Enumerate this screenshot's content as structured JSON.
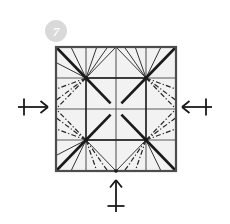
{
  "diagram": {
    "step_number": "7",
    "badge": {
      "label": "7",
      "fill_color": "#d9d9d9",
      "text_color": "#ffffff",
      "cx": 56,
      "cy": 31,
      "r": 11
    },
    "paper": {
      "name": "square-sheet",
      "x": 56,
      "y": 47,
      "width": 120,
      "height": 124,
      "fill_color": "#f2f2f2",
      "edge_color": "#4d4d4d",
      "edge_width": 2.2
    },
    "colors": {
      "background": "#ffffff",
      "paper_fill": "#f2f2f2",
      "paper_edge": "#4d4d4d",
      "mountain_bold": "#1a1a1a",
      "grid_line": "#595959",
      "thin_crease": "#333333",
      "valley_dash": "#262626",
      "arrow": "#1a1a1a"
    },
    "grid": {
      "divisions": 4,
      "vertical_fractions": [
        0.25,
        0.5,
        0.75
      ],
      "horizontal_fractions": [
        0.25,
        0.5,
        0.75
      ],
      "line_width": 1.1
    },
    "nodes": [
      {
        "name": "node-top-left",
        "fx": 0.25,
        "fy": 0.25
      },
      {
        "name": "node-top-right",
        "fx": 0.75,
        "fy": 0.25
      },
      {
        "name": "node-bottom-left",
        "fx": 0.25,
        "fy": 0.75
      },
      {
        "name": "node-bottom-right",
        "fx": 0.75,
        "fy": 0.75
      }
    ],
    "center_gap": 0.045,
    "bold_creases": [
      {
        "name": "mountain-corner-tl-to-node",
        "x1f": 0.0,
        "y1f": 0.0,
        "x2f": 0.25,
        "y2f": 0.25
      },
      {
        "name": "mountain-corner-tr-to-node",
        "x1f": 1.0,
        "y1f": 0.0,
        "x2f": 0.75,
        "y2f": 0.25
      },
      {
        "name": "mountain-corner-bl-to-node",
        "x1f": 0.0,
        "y1f": 1.0,
        "x2f": 0.25,
        "y2f": 0.75
      },
      {
        "name": "mountain-corner-br-to-node",
        "x1f": 1.0,
        "y1f": 1.0,
        "x2f": 0.75,
        "y2f": 0.75
      },
      {
        "name": "mountain-node-tl-to-center",
        "x1f": 0.25,
        "y1f": 0.25,
        "x2f": 0.455,
        "y2f": 0.455
      },
      {
        "name": "mountain-node-br-to-center",
        "x1f": 0.75,
        "y1f": 0.75,
        "x2f": 0.545,
        "y2f": 0.545
      },
      {
        "name": "mountain-node-tr-to-center",
        "x1f": 0.75,
        "y1f": 0.25,
        "x2f": 0.545,
        "y2f": 0.455
      },
      {
        "name": "mountain-node-bl-to-center",
        "x1f": 0.25,
        "y1f": 0.75,
        "x2f": 0.455,
        "y2f": 0.545
      },
      {
        "name": "mountain-node-tl-to-node-tr",
        "x1f": 0.25,
        "y1f": 0.25,
        "x2f": 0.75,
        "y2f": 0.25
      },
      {
        "name": "mountain-node-bl-to-node-br",
        "x1f": 0.25,
        "y1f": 0.75,
        "x2f": 0.75,
        "y2f": 0.75
      },
      {
        "name": "mountain-node-tl-to-node-bl",
        "x1f": 0.25,
        "y1f": 0.25,
        "x2f": 0.25,
        "y2f": 0.75
      },
      {
        "name": "mountain-node-tr-to-node-br",
        "x1f": 0.75,
        "y1f": 0.25,
        "x2f": 0.75,
        "y2f": 0.75
      }
    ],
    "thin_creases": [
      {
        "name": "fan-tl-to-top-left-corner-a",
        "x1f": 0.25,
        "y1f": 0.25,
        "x2f": 0.125,
        "y2f": 0.0
      },
      {
        "name": "fan-tl-to-top-a",
        "x1f": 0.25,
        "y1f": 0.25,
        "x2f": 0.34,
        "y2f": 0.0
      },
      {
        "name": "fan-tl-to-top-b",
        "x1f": 0.25,
        "y1f": 0.25,
        "x2f": 0.43,
        "y2f": 0.0
      },
      {
        "name": "fan-tl-to-top-c",
        "x1f": 0.25,
        "y1f": 0.25,
        "x2f": 0.5,
        "y2f": 0.0
      },
      {
        "name": "fan-tr-to-top-a",
        "x1f": 0.75,
        "y1f": 0.25,
        "x2f": 0.5,
        "y2f": 0.0
      },
      {
        "name": "fan-tr-to-top-b",
        "x1f": 0.75,
        "y1f": 0.25,
        "x2f": 0.57,
        "y2f": 0.0
      },
      {
        "name": "fan-tr-to-top-c",
        "x1f": 0.75,
        "y1f": 0.25,
        "x2f": 0.66,
        "y2f": 0.0
      },
      {
        "name": "fan-tr-to-top-right-corner-a",
        "x1f": 0.75,
        "y1f": 0.25,
        "x2f": 0.875,
        "y2f": 0.0
      },
      {
        "name": "fan-bl-to-bottom-a",
        "x1f": 0.25,
        "y1f": 0.75,
        "x2f": 0.125,
        "y2f": 1.0
      },
      {
        "name": "fan-bl-to-bottom-b",
        "x1f": 0.25,
        "y1f": 0.75,
        "x2f": 0.5,
        "y2f": 1.0
      },
      {
        "name": "fan-br-to-bottom-a",
        "x1f": 0.75,
        "y1f": 0.75,
        "x2f": 0.5,
        "y2f": 1.0
      },
      {
        "name": "fan-br-to-bottom-b",
        "x1f": 0.75,
        "y1f": 0.75,
        "x2f": 0.875,
        "y2f": 1.0
      },
      {
        "name": "fan-tl-to-left-a",
        "x1f": 0.25,
        "y1f": 0.25,
        "x2f": 0.0,
        "y2f": 0.125
      },
      {
        "name": "fan-bl-to-left-a",
        "x1f": 0.25,
        "y1f": 0.75,
        "x2f": 0.0,
        "y2f": 0.875
      }
    ],
    "valley_creases": [
      {
        "name": "valley-tl-to-left-upper",
        "x1f": 0.25,
        "y1f": 0.25,
        "x2f": 0.0,
        "y2f": 0.34
      },
      {
        "name": "valley-tl-to-left-mid",
        "x1f": 0.25,
        "y1f": 0.25,
        "x2f": 0.0,
        "y2f": 0.43
      },
      {
        "name": "valley-tl-to-left-low",
        "x1f": 0.25,
        "y1f": 0.25,
        "x2f": 0.0,
        "y2f": 0.5
      },
      {
        "name": "valley-bl-to-left-upper",
        "x1f": 0.25,
        "y1f": 0.75,
        "x2f": 0.0,
        "y2f": 0.5
      },
      {
        "name": "valley-bl-to-left-mid",
        "x1f": 0.25,
        "y1f": 0.75,
        "x2f": 0.0,
        "y2f": 0.57
      },
      {
        "name": "valley-bl-to-left-low",
        "x1f": 0.25,
        "y1f": 0.75,
        "x2f": 0.0,
        "y2f": 0.66
      },
      {
        "name": "valley-tr-to-right-upper",
        "x1f": 0.75,
        "y1f": 0.25,
        "x2f": 1.0,
        "y2f": 0.34
      },
      {
        "name": "valley-tr-to-right-mid",
        "x1f": 0.75,
        "y1f": 0.25,
        "x2f": 1.0,
        "y2f": 0.43
      },
      {
        "name": "valley-tr-to-right-low",
        "x1f": 0.75,
        "y1f": 0.25,
        "x2f": 1.0,
        "y2f": 0.5
      },
      {
        "name": "valley-br-to-right-upper",
        "x1f": 0.75,
        "y1f": 0.75,
        "x2f": 1.0,
        "y2f": 0.5
      },
      {
        "name": "valley-br-to-right-mid",
        "x1f": 0.75,
        "y1f": 0.75,
        "x2f": 1.0,
        "y2f": 0.57
      },
      {
        "name": "valley-br-to-right-low",
        "x1f": 0.75,
        "y1f": 0.75,
        "x2f": 1.0,
        "y2f": 0.66
      },
      {
        "name": "valley-bl-to-bottom-a",
        "x1f": 0.25,
        "y1f": 0.75,
        "x2f": 0.34,
        "y2f": 1.0
      },
      {
        "name": "valley-bl-to-bottom-b",
        "x1f": 0.25,
        "y1f": 0.75,
        "x2f": 0.43,
        "y2f": 1.0
      },
      {
        "name": "valley-br-to-bottom-a",
        "x1f": 0.75,
        "y1f": 0.75,
        "x2f": 0.57,
        "y2f": 1.0
      },
      {
        "name": "valley-br-to-bottom-b",
        "x1f": 0.75,
        "y1f": 0.75,
        "x2f": 0.66,
        "y2f": 1.0
      }
    ],
    "arrows": [
      {
        "name": "push-arrow-left",
        "direction": "right",
        "tick": "vertical",
        "shaft_x1": 18,
        "shaft_y1": 107,
        "shaft_x2": 48,
        "shaft_y2": 107,
        "tick_pos": 24
      },
      {
        "name": "push-arrow-right",
        "direction": "left",
        "tick": "vertical",
        "shaft_x1": 212,
        "shaft_y1": 107,
        "shaft_x2": 182,
        "shaft_y2": 107,
        "tick_pos": 206
      },
      {
        "name": "push-arrow-bottom",
        "direction": "up",
        "tick": "horizontal",
        "shaft_x1": 116,
        "shaft_y1": 212,
        "shaft_x2": 116,
        "shaft_y2": 180,
        "tick_pos": 206
      }
    ]
  }
}
